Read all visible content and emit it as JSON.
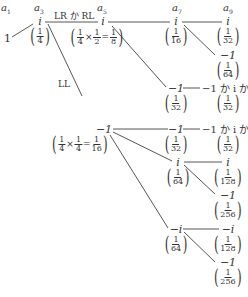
{
  "headers": [
    {
      "label": "a",
      "sub": "1",
      "x": 6
    },
    {
      "label": "a",
      "sub": "3",
      "x": 38
    },
    {
      "label": "a",
      "sub": "5",
      "x": 101
    },
    {
      "label": "a",
      "sub": "7",
      "x": 176
    },
    {
      "label": "a",
      "sub": "9",
      "x": 228
    }
  ],
  "root": {
    "value": "1"
  },
  "edge_labels": {
    "lr_rl": "LR か RL",
    "ll": "LL"
  },
  "nodes": {
    "a3_i": {
      "value": "i",
      "prob_den": "4"
    },
    "a5_i": {
      "value": "i",
      "calc": [
        "1",
        "4",
        "×",
        "1",
        "2",
        "=",
        "1",
        "8"
      ]
    },
    "a5_m1": {
      "value": "−1",
      "calc": [
        "1",
        "4",
        "×",
        "1",
        "4",
        "=",
        "1",
        "16"
      ]
    },
    "a7_i_top": {
      "value": "i",
      "prob_den": "16"
    },
    "a9_i_top": {
      "value": "i",
      "prob_den": "32"
    },
    "a9_m1_top": {
      "value": "−1",
      "prob_den": "64"
    },
    "a7_m1_a": {
      "value": "−1",
      "prob_den": "32"
    },
    "a9_or_a": {
      "value": "−1 か i か−i",
      "prob_den": "32"
    },
    "a7_m1_b": {
      "value": "−1",
      "prob_den": "32"
    },
    "a9_or_b": {
      "value": "−1 か i か−i",
      "prob_den": "32"
    },
    "a7_i_b": {
      "value": "i",
      "prob_den": "64"
    },
    "a9_i_b": {
      "value": "i",
      "prob_den": "128"
    },
    "a9_m1_b": {
      "value": "−1",
      "prob_den": "256"
    },
    "a7_mi": {
      "value": "−i",
      "prob_den": "64"
    },
    "a9_mi": {
      "value": "−i",
      "prob_den": "128"
    },
    "a9_m1_c": {
      "value": "−1",
      "prob_den": "256"
    }
  },
  "fraction_numerator": "1"
}
